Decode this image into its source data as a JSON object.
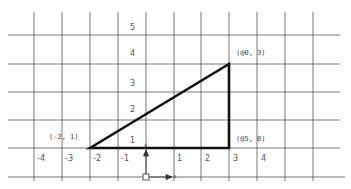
{
  "diagram": {
    "type": "coordinate-grid",
    "colors": {
      "grid": "#555555",
      "triangle": "#111111",
      "text": "#555555",
      "background": "#ffffff"
    },
    "y_tick_labels": [
      "5",
      "4",
      "3",
      "2",
      "1"
    ],
    "x_tick_labels": [
      "-4",
      "-3",
      "-2",
      "-1",
      "1",
      "2",
      "3",
      "4"
    ],
    "points": [
      {
        "label": "(-2, 1)"
      },
      {
        "label": "(@0, 3)"
      },
      {
        "label": "(@5, 0)"
      }
    ],
    "axis_gizmo": {
      "x_label": "x",
      "y_label": "y"
    }
  }
}
